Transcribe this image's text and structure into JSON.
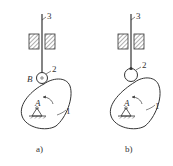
{
  "figure": {
    "panels": [
      {
        "id": "a",
        "caption": "a)",
        "labels": {
          "follower": "3",
          "roller": "2",
          "cam": "1",
          "pivot": "A",
          "roller_center": "B"
        }
      },
      {
        "id": "b",
        "caption": "b)",
        "labels": {
          "follower": "3",
          "roller": "2",
          "cam": "1",
          "pivot": "A"
        }
      }
    ],
    "colors": {
      "line": "#333333",
      "background": "#ffffff"
    }
  }
}
